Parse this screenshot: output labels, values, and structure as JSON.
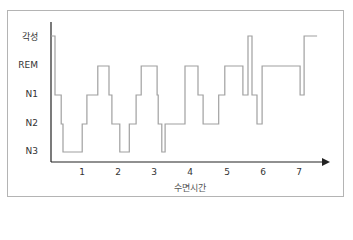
{
  "chart_data": {
    "type": "line",
    "subtype": "step-hypnogram",
    "title": "",
    "xlabel": "수면시간",
    "ylabel": "",
    "x_ticks": [
      "1",
      "2",
      "3",
      "4",
      "5",
      "6",
      "7"
    ],
    "y_categories": [
      "각성",
      "REM",
      "N1",
      "N2",
      "N3"
    ],
    "xlim": [
      0,
      7.6
    ],
    "grid": false,
    "legend": null,
    "line_color": "#a0a0a0",
    "steps": [
      {
        "start": 0.0,
        "end": 0.25,
        "stage": "각성"
      },
      {
        "start": 0.25,
        "end": 0.42,
        "stage": "N1"
      },
      {
        "start": 0.42,
        "end": 0.47,
        "stage": "N2"
      },
      {
        "start": 0.47,
        "end": 1.0,
        "stage": "N3"
      },
      {
        "start": 1.0,
        "end": 1.13,
        "stage": "N2"
      },
      {
        "start": 1.13,
        "end": 1.43,
        "stage": "N1"
      },
      {
        "start": 1.43,
        "end": 1.74,
        "stage": "REM"
      },
      {
        "start": 1.74,
        "end": 1.82,
        "stage": "N1"
      },
      {
        "start": 1.82,
        "end": 2.04,
        "stage": "N2"
      },
      {
        "start": 2.04,
        "end": 2.3,
        "stage": "N3"
      },
      {
        "start": 2.3,
        "end": 2.49,
        "stage": "N2"
      },
      {
        "start": 2.49,
        "end": 2.63,
        "stage": "N1"
      },
      {
        "start": 2.63,
        "end": 3.07,
        "stage": "REM"
      },
      {
        "start": 3.07,
        "end": 3.1,
        "stage": "N1"
      },
      {
        "start": 3.1,
        "end": 3.2,
        "stage": "N2"
      },
      {
        "start": 3.2,
        "end": 3.29,
        "stage": "N3"
      },
      {
        "start": 3.29,
        "end": 3.84,
        "stage": "N2"
      },
      {
        "start": 3.84,
        "end": 4.2,
        "stage": "REM"
      },
      {
        "start": 4.2,
        "end": 4.34,
        "stage": "N1"
      },
      {
        "start": 4.34,
        "end": 4.77,
        "stage": "N2"
      },
      {
        "start": 4.77,
        "end": 4.94,
        "stage": "N1"
      },
      {
        "start": 4.94,
        "end": 5.44,
        "stage": "REM"
      },
      {
        "start": 5.44,
        "end": 5.58,
        "stage": "N1"
      },
      {
        "start": 5.58,
        "end": 5.69,
        "stage": "각성"
      },
      {
        "start": 5.69,
        "end": 5.83,
        "stage": "N1"
      },
      {
        "start": 5.83,
        "end": 5.97,
        "stage": "N2"
      },
      {
        "start": 5.97,
        "end": 7.02,
        "stage": "REM"
      },
      {
        "start": 7.02,
        "end": 7.13,
        "stage": "N1"
      },
      {
        "start": 7.13,
        "end": 7.49,
        "stage": "각성"
      }
    ]
  },
  "axes": {
    "y_labels": [
      "각성",
      "REM",
      "N1",
      "N2",
      "N3"
    ],
    "x_labels": [
      "1",
      "2",
      "3",
      "4",
      "5",
      "6",
      "7"
    ],
    "x_title": "수면시간"
  }
}
